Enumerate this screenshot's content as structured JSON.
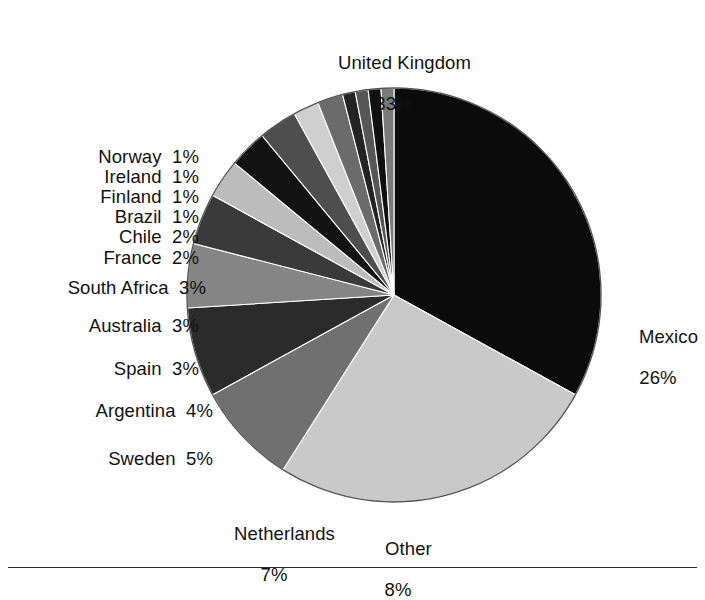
{
  "chart_data": {
    "type": "pie",
    "title": "",
    "subtitle": "",
    "xlabel": "",
    "ylabel": "",
    "legend_position": "none",
    "grid": false,
    "units": "percent",
    "start_angle_deg": 0,
    "direction": "clockwise",
    "total": 100,
    "categories": [
      "United Kingdom",
      "Mexico",
      "Other",
      "Netherlands",
      "Sweden",
      "Argentina",
      "Spain",
      "Australia",
      "South Africa",
      "France",
      "Chile",
      "Brazil",
      "Finland",
      "Ireland",
      "Norway"
    ],
    "values": [
      33,
      26,
      8,
      7,
      5,
      4,
      3,
      3,
      3,
      2,
      2,
      1,
      1,
      1,
      1
    ],
    "slices": [
      {
        "label": "United Kingdom",
        "value": 33,
        "pct_text": "33%",
        "color": "#0b0b0b"
      },
      {
        "label": "Mexico",
        "value": 26,
        "pct_text": "26%",
        "color": "#c9c9c9"
      },
      {
        "label": "Other",
        "value": 8,
        "pct_text": "8%",
        "color": "#707070"
      },
      {
        "label": "Netherlands",
        "value": 7,
        "pct_text": "7%",
        "color": "#2b2b2b"
      },
      {
        "label": "Sweden",
        "value": 5,
        "pct_text": "5%",
        "color": "#858585"
      },
      {
        "label": "Argentina",
        "value": 4,
        "pct_text": "4%",
        "color": "#3a3a3a"
      },
      {
        "label": "Spain",
        "value": 3,
        "pct_text": "3%",
        "color": "#bcbcbc"
      },
      {
        "label": "Australia",
        "value": 3,
        "pct_text": "3%",
        "color": "#121212"
      },
      {
        "label": "South Africa",
        "value": 3,
        "pct_text": "3%",
        "color": "#4e4e4e"
      },
      {
        "label": "France",
        "value": 2,
        "pct_text": "2%",
        "color": "#cfcfcf"
      },
      {
        "label": "Chile",
        "value": 2,
        "pct_text": "2%",
        "color": "#6b6b6b"
      },
      {
        "label": "Brazil",
        "value": 1,
        "pct_text": "1%",
        "color": "#232323"
      },
      {
        "label": "Finland",
        "value": 1,
        "pct_text": "1%",
        "color": "#565656"
      },
      {
        "label": "Ireland",
        "value": 1,
        "pct_text": "1%",
        "color": "#101010"
      },
      {
        "label": "Norway",
        "value": 1,
        "pct_text": "1%",
        "color": "#7a7a7a"
      }
    ]
  },
  "labels": {
    "united_kingdom": {
      "name": "United Kingdom",
      "pct": "33%"
    },
    "mexico": {
      "name": "Mexico",
      "pct": "26%"
    },
    "other": {
      "name": "Other",
      "pct": "8%"
    },
    "netherlands": {
      "name": "Netherlands",
      "pct": "7%"
    },
    "sweden": {
      "name": "Sweden  5%"
    },
    "argentina": {
      "name": "Argentina  4%"
    },
    "spain": {
      "name": "Spain  3%"
    },
    "australia": {
      "name": "Australia  3%"
    },
    "south_africa": {
      "name": "South Africa  3%"
    },
    "france": {
      "name": "France  2%"
    },
    "chile": {
      "name": "Chile  2%"
    },
    "brazil": {
      "name": "Brazil  1%"
    },
    "finland": {
      "name": "Finland  1%"
    },
    "ireland": {
      "name": "Ireland  1%"
    },
    "norway": {
      "name": "Norway  1%"
    }
  },
  "geometry": {
    "center_x": 394,
    "center_y": 295,
    "radius": 207
  },
  "colors": {
    "background": "#ffffff",
    "text": "#111111",
    "outline": "#555555",
    "rule": "#2a2a2a"
  }
}
